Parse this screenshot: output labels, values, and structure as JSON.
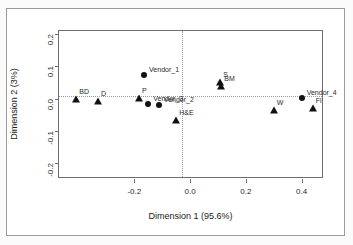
{
  "chart_data": {
    "type": "scatter",
    "title": "",
    "xlabel": "Dimension 1 (95.6%)",
    "ylabel": "Dimension 2 (3%)",
    "xlim": [
      -0.47,
      0.48
    ],
    "ylim": [
      -0.25,
      0.21
    ],
    "xticks": [
      -0.2,
      0.0,
      0.2,
      0.4
    ],
    "xticklabels": [
      "-0.2",
      "0.0",
      "0.2",
      "0.4"
    ],
    "yticks": [
      0.2,
      0.1,
      0.0,
      -0.1,
      -0.2
    ],
    "yticklabels": [
      "0.2",
      "0.1",
      "0.0",
      "-0.1",
      "-0.2"
    ],
    "grid": false,
    "legend": "none",
    "reference_lines": {
      "vertical_at_x": 0.0,
      "horizontal_at_y": 0.0,
      "style": "dotted"
    },
    "series": [
      {
        "name": "Vendors",
        "marker": "filled-circle",
        "color": "#111111",
        "points": [
          {
            "label": "Vendor_1",
            "x": -0.165,
            "y": 0.073,
            "label_pos": "right"
          },
          {
            "label": "Vendor_3",
            "x": -0.15,
            "y": -0.017,
            "label_pos": "right"
          },
          {
            "label": "Vendor_2",
            "x": -0.112,
            "y": -0.02,
            "label_pos": "right"
          },
          {
            "label": "Vendor_4",
            "x": 0.4,
            "y": 0.001,
            "label_pos": "right"
          }
        ]
      },
      {
        "name": "Methods",
        "marker": "filled-triangle",
        "color": "#111111",
        "points": [
          {
            "label": "BD",
            "x": -0.408,
            "y": 0.0,
            "label_pos": "upright"
          },
          {
            "label": "D",
            "x": -0.33,
            "y": -0.007,
            "label_pos": "upright"
          },
          {
            "label": "P",
            "x": -0.183,
            "y": 0.003,
            "label_pos": "upright"
          },
          {
            "label": "H&E",
            "x": -0.05,
            "y": -0.067,
            "label_pos": "upright"
          },
          {
            "label": "S",
            "x": 0.108,
            "y": 0.05,
            "label_pos": "upright"
          },
          {
            "label": "BM",
            "x": 0.112,
            "y": 0.04,
            "label_pos": "upright"
          },
          {
            "label": "W",
            "x": 0.3,
            "y": -0.037,
            "label_pos": "upright"
          },
          {
            "label": "Fl",
            "x": 0.44,
            "y": -0.028,
            "label_pos": "upright"
          }
        ]
      }
    ]
  },
  "axes": {
    "x_title": "Dimension 1 (95.6%)",
    "y_title": "Dimension 2 (3%)"
  }
}
